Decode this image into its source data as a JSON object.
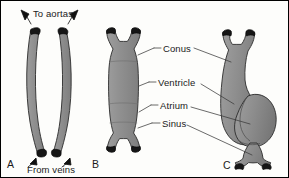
{
  "figure": {
    "kind": "anatomical-diagram",
    "background_color": "#fdfdfb",
    "organ_fill_color": "#8c8c8c",
    "organ_fill_color_light": "#9a9a9a",
    "organ_outline_color": "#2b2b2b",
    "vessel_end_color": "#161616",
    "leader_line_color": "#3a3a3a",
    "text_color": "#1a1a1a",
    "border_color": "#000000"
  },
  "labels": {
    "parts": [
      {
        "id": "conus",
        "text": "Conus"
      },
      {
        "id": "ventricle",
        "text": "Ventricle"
      },
      {
        "id": "atrium",
        "text": "Atrium"
      },
      {
        "id": "sinus",
        "text": "Sinus"
      }
    ],
    "flow": [
      {
        "id": "to-aortas",
        "text": "To aortas"
      },
      {
        "id": "from-veins",
        "text": "From veins"
      }
    ],
    "panels": [
      {
        "id": "panel-a",
        "text": "A"
      },
      {
        "id": "panel-b",
        "text": "B"
      },
      {
        "id": "panel-c",
        "text": "C"
      }
    ]
  }
}
